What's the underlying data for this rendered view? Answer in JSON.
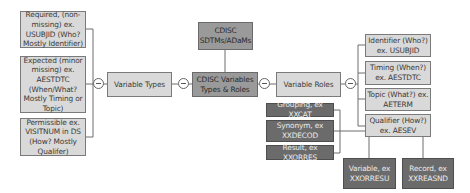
{
  "center": {
    "title": "CDISC Variables Types & Roles",
    "source": "CDISC SDTMs/ADaMs"
  },
  "variable_types": {
    "label": "Variable Types",
    "items": [
      {
        "label": "Required, (non-missing) ex. USUBJID (Who? Mostly Identifier)"
      },
      {
        "label": "Expected (minor missing) ex. AESTDTC (When/What? Mostly Timing or Topic)"
      },
      {
        "label": "Permissible ex. VISITNUM in DS (How? Mostly Qualifer)"
      }
    ]
  },
  "variable_roles": {
    "label": "Variable Roles",
    "items": [
      {
        "label": "Identifier (Who?) ex. USUBJID"
      },
      {
        "label": "Timing (When?) ex. AESTDTC"
      },
      {
        "label": "Topic (What?) ex. AETERM"
      },
      {
        "label": "Qualifier (How?) ex. AESEV"
      }
    ]
  },
  "qualifier_types": {
    "left": [
      {
        "label": "Grouping, ex XXCAT"
      },
      {
        "label": "Synonym, ex XXDECOD"
      },
      {
        "label": "Result, ex XXORRES"
      }
    ],
    "bottom": [
      {
        "label": "Variable, ex XXORRESU"
      },
      {
        "label": "Record, ex XXREASND"
      }
    ]
  },
  "colors": {
    "light_box": "#d9d9d9",
    "mid_box": "#9a9a9a",
    "dark_box": "#6b6b6b",
    "line": "#6d6d6d"
  }
}
